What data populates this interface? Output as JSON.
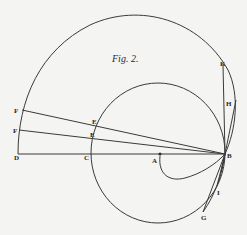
{
  "figure": {
    "title": "Fig. 2.",
    "labels": {
      "K": "K",
      "H": "H",
      "F1": "F",
      "F2": "F",
      "E1": "E",
      "E2": "E",
      "D": "D",
      "C": "C",
      "A": "A",
      "B": "B",
      "I": "I",
      "G": "G"
    }
  }
}
